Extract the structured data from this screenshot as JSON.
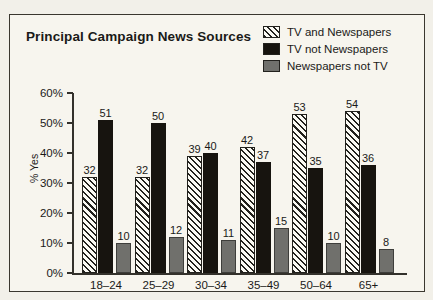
{
  "figure": {
    "title": "Principal Campaign News Sources"
  },
  "legend": {
    "position": "top-right",
    "items": [
      {
        "label": "TV and Newspapers",
        "swatch": "hatch-diagonal-swatch",
        "color": "#fbfaf4"
      },
      {
        "label": "TV not Newspapers",
        "swatch": "solid-black-swatch",
        "color": "#17140f"
      },
      {
        "label": "Newspapers not TV",
        "swatch": "solid-gray-swatch",
        "color": "#70706c"
      }
    ]
  },
  "chart_data": {
    "type": "bar",
    "title": "Principal Campaign News Sources",
    "xlabel": "Age-Group",
    "ylabel": "% Yes",
    "ylim": [
      0,
      60
    ],
    "yticks": [
      0,
      10,
      20,
      30,
      40,
      50,
      60
    ],
    "ytick_labels": [
      "0%",
      "10%",
      "20%",
      "30%",
      "40%",
      "50%",
      "60%"
    ],
    "grid": false,
    "categories": [
      "18–24",
      "25–29",
      "30–34",
      "35–49",
      "50–64",
      "65+"
    ],
    "series": [
      {
        "name": "TV and Newspapers",
        "values": [
          32,
          32,
          39,
          42,
          53,
          54
        ]
      },
      {
        "name": "TV not Newspapers",
        "values": [
          51,
          50,
          40,
          37,
          35,
          36
        ]
      },
      {
        "name": "Newspapers not TV",
        "values": [
          10,
          12,
          11,
          15,
          10,
          8
        ]
      }
    ]
  },
  "axes": {
    "y_title": "% Yes",
    "x_title": "Age-Group"
  }
}
